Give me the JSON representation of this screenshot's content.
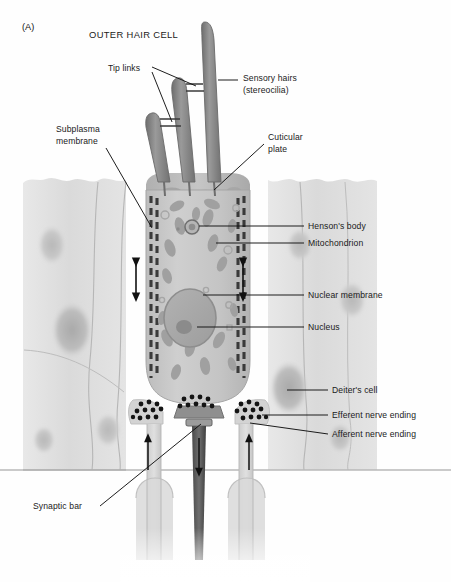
{
  "figure": {
    "panel_label": "(A)",
    "title": "OUTER HAIR CELL",
    "domain": "anatomical-diagram",
    "background_color": "#fefefe",
    "ink_color": "#1a1a1a",
    "cell_fill": "#c9c9c9",
    "deiter_fill": "#dcdcdc",
    "organelle_fill": "#9a9a9a",
    "stereocilia_fill": "#8e8e8e"
  },
  "labels": {
    "tip_links": {
      "text": "Tip links",
      "x": 108,
      "y": 63,
      "side": "left"
    },
    "sensory_hairs": {
      "text": "Sensory hairs\n(stereocilia)",
      "x": 243,
      "y": 78,
      "side": "right"
    },
    "subplasma_membrane": {
      "text": "Subplasma\nmembrane",
      "x": 56,
      "y": 126,
      "side": "left"
    },
    "cuticular_plate": {
      "text": "Cuticular\nplate",
      "x": 268,
      "y": 136,
      "side": "right"
    },
    "hensons_body": {
      "text": "Henson's body",
      "x": 308,
      "y": 221,
      "side": "right"
    },
    "mitochondrion": {
      "text": "Mitochondrion",
      "x": 308,
      "y": 238,
      "side": "right"
    },
    "nuclear_membrane": {
      "text": "Nuclear membrane",
      "x": 308,
      "y": 290,
      "side": "right"
    },
    "nucleus": {
      "text": "Nucleus",
      "x": 308,
      "y": 322,
      "side": "right"
    },
    "deiters_cell": {
      "text": "Deiter's cell",
      "x": 332,
      "y": 386,
      "side": "right"
    },
    "efferent_nerve_ending": {
      "text": "Efferent nerve ending",
      "x": 332,
      "y": 411,
      "side": "right"
    },
    "afferent_nerve_ending": {
      "text": "Afferent nerve ending",
      "x": 332,
      "y": 430,
      "side": "right"
    },
    "synaptic_bar": {
      "text": "Synaptic bar",
      "x": 33,
      "y": 508,
      "side": "left"
    }
  },
  "structures": {
    "stereocilia_count": 3,
    "stereocilia_heights": [
      "tall",
      "medium",
      "short"
    ],
    "tip_link_count": 2,
    "motility_arrows": {
      "count": 2,
      "type": "double-headed-vertical",
      "meaning": "electromotility"
    },
    "flow_arrows": {
      "count": 3,
      "directions": [
        "up",
        "down",
        "up"
      ]
    },
    "nerve_fibers": [
      {
        "name": "afferent-fiber-left",
        "shade": "light"
      },
      {
        "name": "efferent-fiber-center",
        "shade": "dark"
      },
      {
        "name": "afferent-fiber-right",
        "shade": "light"
      }
    ],
    "synaptic_vesicle_clusters": 3,
    "subplasma_cisternae_rows": 2
  }
}
